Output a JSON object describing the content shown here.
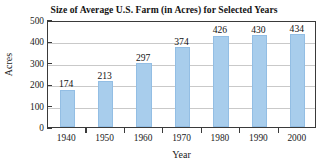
{
  "chart_data": {
    "type": "bar",
    "title": "Size of Average U.S. Farm (in Acres) for Selected Years",
    "xlabel": "Year",
    "ylabel": "Acres",
    "categories": [
      "1940",
      "1950",
      "1960",
      "1970",
      "1980",
      "1990",
      "2000"
    ],
    "values": [
      174,
      213,
      297,
      374,
      426,
      430,
      434
    ],
    "value_labels": [
      "174",
      "213",
      "297",
      "374",
      "426",
      "430",
      "434"
    ],
    "series": [
      {
        "name": "Average farm size (acres)",
        "values": [
          174,
          213,
          297,
          374,
          426,
          430,
          434
        ]
      }
    ],
    "ylim": [
      0,
      500
    ],
    "yticks": [
      0,
      100,
      200,
      300,
      400,
      500
    ],
    "ytick_labels": [
      "0",
      "100",
      "200",
      "300",
      "400",
      "500"
    ],
    "grid": "horizontal",
    "legend": "none",
    "bar_color": "#a8cdec",
    "grid_color": "#c9c9c9",
    "axis_color": "#3a3a3a",
    "text_color": "#1a1a1a"
  }
}
